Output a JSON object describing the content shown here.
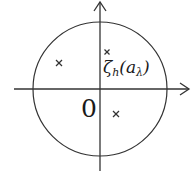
{
  "diagram": {
    "type": "complex-plane-unit-circle",
    "colors": {
      "stroke": "#333333",
      "text": "#1a1a1a",
      "background": "#ffffff"
    },
    "origin_label": "0",
    "circle": {
      "cx": 100,
      "cy": 89,
      "r": 67
    },
    "axes": {
      "horizontal": {
        "x1": 14,
        "x2": 189,
        "y": 89,
        "arrow": "right"
      },
      "vertical": {
        "x": 100,
        "y1": 171,
        "y2": 2,
        "arrow": "up"
      }
    },
    "points": [
      {
        "name": "point-upper-left",
        "x": 59,
        "y": 63,
        "marker": "×"
      },
      {
        "name": "point-near-axis",
        "x": 107,
        "y": 52,
        "marker": "×"
      },
      {
        "name": "point-lower-right",
        "x": 116,
        "y": 114,
        "marker": "×"
      }
    ],
    "point_label": {
      "symbol": "ζ",
      "subscript": "h",
      "argument_open": "(a",
      "argument_subscript": "λ",
      "argument_close": ")"
    }
  }
}
